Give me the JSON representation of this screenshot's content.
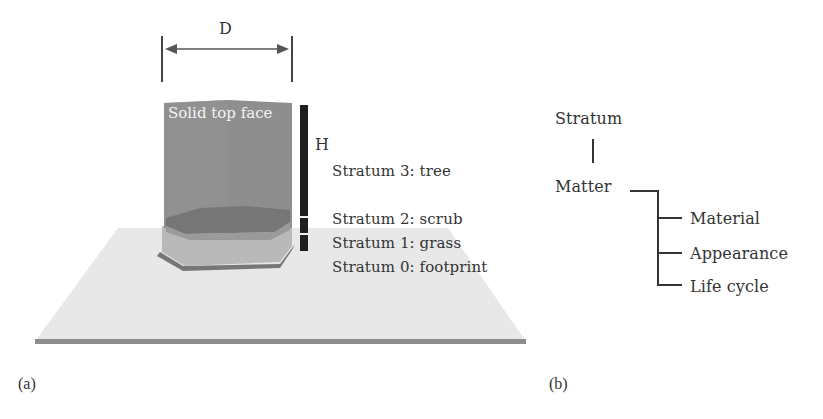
{
  "figure": {
    "panel_a": {
      "tag": "(a)",
      "dimension_width_label": "D",
      "dimension_height_label": "H",
      "top_face_label": "Solid top face",
      "strata": [
        {
          "index": 3,
          "label": "Stratum 3: tree"
        },
        {
          "index": 2,
          "label": "Stratum 2: scrub"
        },
        {
          "index": 1,
          "label": "Stratum 1: grass"
        },
        {
          "index": 0,
          "label": "Stratum 0: footprint"
        }
      ],
      "colors": {
        "tree_block": "#8f8f8f",
        "scrub_layer": "#7a7a7a",
        "grass_layer": "#b8b8b8",
        "footprint_edge": "#6e6e6e",
        "ground_plane": "#e6e6e6",
        "ground_edge": "#8a8a8a",
        "height_bar": "#1f1f1f"
      }
    },
    "panel_b": {
      "tag": "(b)",
      "root": "Stratum",
      "child": "Matter",
      "attributes": [
        "Material",
        "Appearance",
        "Life cycle"
      ]
    }
  }
}
